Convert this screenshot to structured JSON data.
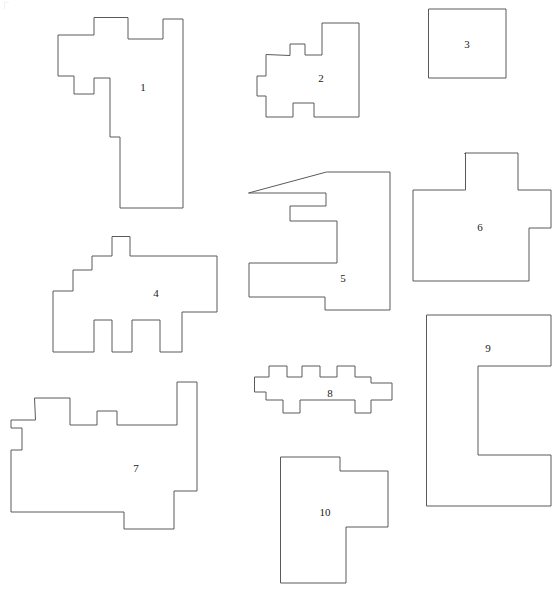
{
  "page": {
    "title": "Rectilinear Polygon Figure",
    "background_color": "#ffffff",
    "stroke_color": "#5a5a5a",
    "label_color": "#1a1a1a",
    "width": 558,
    "height": 589,
    "shape_count": 10
  },
  "chart_data": {
    "type": "diagram",
    "title": "",
    "shapes": [
      {
        "id": 1,
        "label": "1",
        "label_x": 143,
        "label_y": 88,
        "bbox": [
          57,
          18,
          183,
          208
        ],
        "points": "94,18 94,35 58,35 58,76 74,76 74,94 94,94 94,78 110,78 110,137 120,137 120,208 183,208 183,19 163,19 163,39 128,39 128,18"
      },
      {
        "id": 2,
        "label": "2",
        "label_x": 321,
        "label_y": 79,
        "bbox": [
          257,
          23,
          359,
          117
        ],
        "points": "290,55 290,44 305,44 305,55 322,55 322,23 359,23 359,117 314,117 314,103 293,103 293,117 266,117 266,96 257,96 257,76 266,76 266,55"
      },
      {
        "id": 3,
        "label": "3",
        "label_x": 467,
        "label_y": 45,
        "bbox": [
          429,
          9,
          506,
          78
        ],
        "points": "429,9 506,9 506,78 429,78"
      },
      {
        "id": 4,
        "label": "4",
        "label_x": 156,
        "label_y": 294,
        "bbox": [
          53,
          237,
          217,
          352
        ],
        "points": "112,237 112,256 92,256 92,270 73,270 73,291 53,291 53,352 94,352 94,320 112,320 112,352 132,352 132,320 160,320 160,352 182,352 182,312 217,312 217,256 130,256 130,237"
      },
      {
        "id": 5,
        "label": "5",
        "label_x": 343,
        "label_y": 279,
        "bbox": [
          249,
          172,
          390,
          310
        ],
        "points": "327,172 390,172 390,310 325,310 325,297 249,297 249,263 337,263 337,221 290,221 290,206 326,206 326,193 249,193 249,193 249,193"
      },
      {
        "id": 6,
        "label": "6",
        "label_x": 480,
        "label_y": 228,
        "bbox": [
          413,
          153,
          551,
          281
        ],
        "points": "465,153 465,153 465,153 465,154 465,153 518,153 518,190 551,190 551,228 529,228 529,281 413,281 413,190 465,190"
      },
      {
        "id": 7,
        "label": "7",
        "label_x": 136,
        "label_y": 469,
        "bbox": [
          11,
          382,
          197,
          529
        ],
        "points": "35,398 70,398 70,425 97,425 97,411 117,411 117,425 177,425 177,382 197,382 197,491 174,491 174,529 124,529 124,512 11,512 11,450 22,450 22,428 11,428 11,420 35,420"
      },
      {
        "id": 8,
        "label": "8",
        "label_x": 330,
        "label_y": 394,
        "bbox": [
          255,
          366,
          392,
          413
        ],
        "points": "255,377 269,377 269,366 287,366 287,377 302,377 302,366 320,366 320,377 337,377 337,366 355,366 355,377 371,377 371,383 392,383 392,400 371,400 371,413 355,413 355,400 300,400 300,413 283,413 283,400 266,400 266,392 255,392"
      },
      {
        "id": 9,
        "label": "9",
        "label_x": 488,
        "label_y": 349,
        "bbox": [
          427,
          315,
          551,
          506
        ],
        "points": "427,315 551,315 551,366 478,366 478,455 551,455 551,506 427,506"
      },
      {
        "id": 10,
        "label": "10",
        "label_x": 325,
        "label_y": 513,
        "bbox": [
          281,
          457,
          388,
          583
        ],
        "points": "281,457 340,457 340,471 388,471 388,527 346,527 346,583 281,583"
      }
    ]
  }
}
